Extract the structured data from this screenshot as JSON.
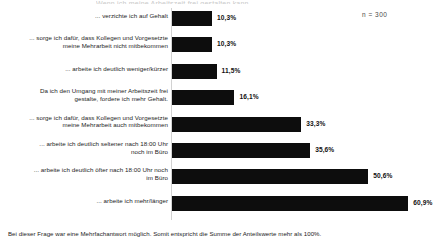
{
  "title_remnant": "Wenn ich meine Arbeitszeit frei gestalten kann, ...",
  "sample_size_label": "n = 300",
  "footnote": "Bei dieser Frage war eine Mehrfachantwort möglich. Somit entspricht die Summe der Anteilswerte mehr als 100%.",
  "value_suffix": "%",
  "chart_data": {
    "type": "bar",
    "orientation": "horizontal",
    "title": "",
    "subtitle": "",
    "xlabel": "",
    "ylabel": "",
    "xlim": [
      0,
      65
    ],
    "grid": false,
    "legend": null,
    "bar_color": "#0d0d0d",
    "annotations": [
      "n = 300",
      "Bei dieser Frage war eine Mehrfachantwort möglich. Somit entspricht die Summe der Anteilswerte mehr als 100%."
    ],
    "categories": [
      "... verzichte ich auf Gehalt",
      "... sorge ich dafür, dass Kollegen und Vorgesetzte meine Mehrarbeit nicht mitbekommen",
      "... arbeite ich deutlich weniger/kürzer",
      "Da ich den Umgang mit meiner Arbeitszeit frei gestalte, fordere ich mehr Gehalt.",
      "... sorge ich dafür, dass Kollegen und Vorgesetzte meine Mehrarbeit auch mitbekommen",
      "... arbeite ich deutlich seltener nach 18:00 Uhr noch im Büro",
      "... arbeite ich deutlich öfter nach 18:00 Uhr noch im Büro",
      "... arbeite ich mehr/länger"
    ],
    "values": [
      10.3,
      10.3,
      11.5,
      16.1,
      33.3,
      35.6,
      50.6,
      60.9
    ],
    "value_labels": [
      "10,3%",
      "10,3%",
      "11,5%",
      "16,1%",
      "33,3%",
      "35,6%",
      "50,6%",
      "60,9%"
    ]
  },
  "bars": [
    {
      "label_line1": "... verzichte ich auf Gehalt",
      "label_line2": "",
      "value_label": "10,3%"
    },
    {
      "label_line1": "... sorge ich dafür, dass Kollegen und Vorgesetzte",
      "label_line2": "meine Mehrarbeit nicht mitbekommen",
      "value_label": "10,3%"
    },
    {
      "label_line1": "... arbeite ich deutlich weniger/kürzer",
      "label_line2": "",
      "value_label": "11,5%"
    },
    {
      "label_line1": "Da ich den Umgang mit meiner Arbeitszeit frei",
      "label_line2": "gestalte, fordere ich mehr Gehalt.",
      "value_label": "16,1%"
    },
    {
      "label_line1": "... sorge ich dafür, dass Kollegen und Vorgesetzte",
      "label_line2": "meine Mehrarbeit auch mitbekommen",
      "value_label": "33,3%"
    },
    {
      "label_line1": "... arbeite ich deutlich seltener nach 18:00 Uhr",
      "label_line2": "noch im Büro",
      "value_label": "35,6%"
    },
    {
      "label_line1": "... arbeite ich deutlich öfter nach 18:00 Uhr  noch",
      "label_line2": "im Büro",
      "value_label": "50,6%"
    },
    {
      "label_line1": "... arbeite ich mehr/länger",
      "label_line2": "",
      "value_label": "60,9%"
    }
  ]
}
